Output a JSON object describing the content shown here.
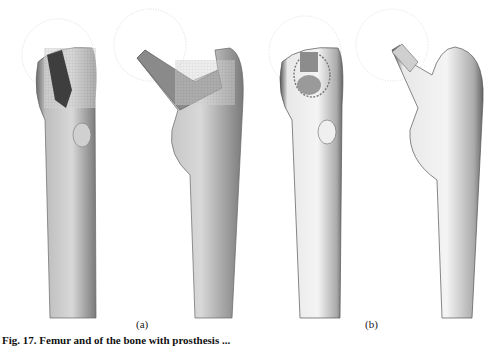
{
  "figure": {
    "panels": [
      {
        "label": "(a)",
        "description": "Femur with prosthesis, mesh model: front and side views"
      },
      {
        "label": "(b)",
        "description": "Femur with prosthesis, smooth surface model: front and side views"
      }
    ],
    "caption": "Fig. 17. Femur and of the bone with prosthesis ..."
  }
}
